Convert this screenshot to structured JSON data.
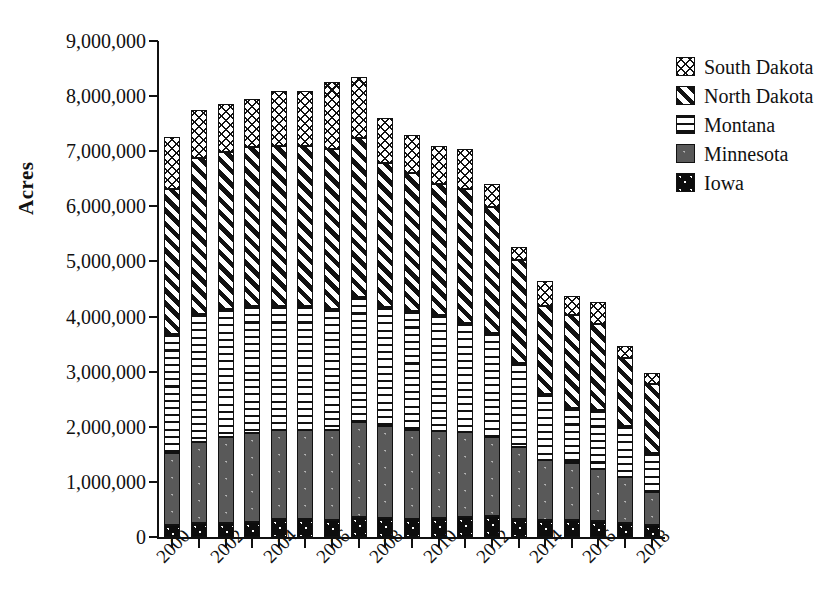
{
  "chart_data": {
    "type": "bar",
    "subtype": "stacked-column",
    "title": "",
    "xlabel": "",
    "ylabel": "Acres",
    "ylim": [
      0,
      9000000
    ],
    "ytick_values": [
      0,
      1000000,
      2000000,
      3000000,
      4000000,
      5000000,
      6000000,
      7000000,
      8000000,
      9000000
    ],
    "ytick_labels": [
      "0",
      "1,000,000",
      "2,000,000",
      "3,000,000",
      "4,000,000",
      "5,000,000",
      "6,000,000",
      "7,000,000",
      "8,000,000",
      "9,000,000"
    ],
    "grid": false,
    "legend_position": "top-right",
    "categories": [
      2000,
      2001,
      2002,
      2003,
      2004,
      2005,
      2006,
      2007,
      2008,
      2009,
      2010,
      2011,
      2012,
      2013,
      2014,
      2015,
      2016,
      2017,
      2018
    ],
    "xtick_labels": [
      "2000",
      "2002",
      "2004",
      "2006",
      "2008",
      "2010",
      "2012",
      "2014",
      "2016",
      "2018"
    ],
    "xtick_step_years": 2,
    "series": [
      {
        "name": "Iowa",
        "pattern": "solid-black",
        "color": "#0d0d0d",
        "values": [
          220000,
          250000,
          250000,
          280000,
          330000,
          330000,
          300000,
          360000,
          340000,
          330000,
          340000,
          370000,
          390000,
          330000,
          310000,
          300000,
          290000,
          250000,
          220000
        ]
      },
      {
        "name": "Minnesota",
        "pattern": "solid-gray",
        "color": "#595959",
        "values": [
          1300000,
          1470000,
          1570000,
          1600000,
          1620000,
          1620000,
          1640000,
          1730000,
          1670000,
          1610000,
          1590000,
          1540000,
          1430000,
          1300000,
          1080000,
          1040000,
          940000,
          840000,
          590000
        ]
      },
      {
        "name": "Montana",
        "pattern": "horizontal-stripes",
        "color": "#ffffff",
        "values": [
          2160000,
          2320000,
          2320000,
          2320000,
          2240000,
          2240000,
          2200000,
          2270000,
          2160000,
          2170000,
          2100000,
          1980000,
          1890000,
          1530000,
          1200000,
          1000000,
          1080000,
          930000,
          710000
        ]
      },
      {
        "name": "North Dakota",
        "pattern": "diagonal-stripes",
        "color": "#ffffff",
        "values": [
          2640000,
          2840000,
          2850000,
          2880000,
          2910000,
          2900000,
          2900000,
          2880000,
          2620000,
          2500000,
          2380000,
          2430000,
          2270000,
          1860000,
          1600000,
          1680000,
          1550000,
          1230000,
          1250000
        ]
      },
      {
        "name": "South Dakota",
        "pattern": "cross-hatch",
        "color": "#ffffff",
        "values": [
          930000,
          870000,
          870000,
          870000,
          990000,
          1010000,
          1210000,
          1110000,
          820000,
          690000,
          690000,
          720000,
          430000,
          240000,
          450000,
          360000,
          400000,
          220000,
          200000
        ]
      }
    ],
    "totals": [
      7250000,
      7750000,
      7860000,
      7950000,
      8090000,
      8100000,
      8250000,
      8350000,
      7610000,
      7300000,
      7100000,
      7040000,
      6410000,
      5260000,
      4640000,
      4380000,
      4260000,
      3470000,
      2970000
    ]
  },
  "legend": {
    "entries": [
      {
        "label": "South Dakota",
        "swatch": "cross-hatch-swatch"
      },
      {
        "label": "North Dakota",
        "swatch": "diagonal-stripes-swatch"
      },
      {
        "label": "Montana",
        "swatch": "horizontal-stripes-swatch"
      },
      {
        "label": "Minnesota",
        "swatch": "solid-gray-swatch"
      },
      {
        "label": "Iowa",
        "swatch": "solid-black-swatch"
      }
    ]
  }
}
